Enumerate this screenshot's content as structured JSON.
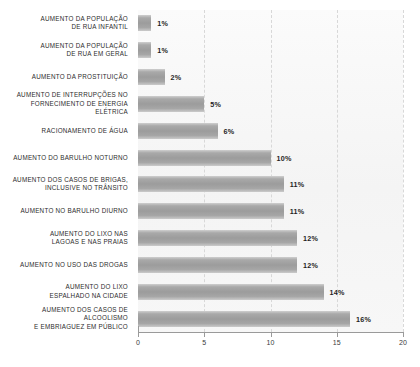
{
  "chart_data": {
    "type": "bar",
    "orientation": "horizontal",
    "title": "",
    "subtitle": "",
    "xlabel": "",
    "ylabel": "",
    "xlim": [
      0,
      20
    ],
    "xticks": [
      0,
      5,
      10,
      15,
      20
    ],
    "xtick_labels": [
      "0",
      "5",
      "10",
      "15",
      "20"
    ],
    "grid": true,
    "grid_axis": "x",
    "grid_style": "dashed",
    "legend": false,
    "value_suffix": "%",
    "bar_color": "#a3a3a3",
    "plot_background": "#f7f7f7",
    "categories": [
      "AUMENTO DA POPULAÇÃO\nDE RUA INFANTIL",
      "AUMENTO DA POPULAÇÃO\nDE RUA EM GERAL",
      "AUMENTO DA PROSTITUIÇÃO",
      "AUMENTO DE INTERRUPÇÕES NO\nFORNECIMENTO DE ENERGIA ELÉTRICA",
      "RACIONAMENTO DE ÁGUA",
      "AUMENTO DO BARULHO NOTURNO",
      "AUMENTO DOS CASOS DE BRIGAS,\nINCLUSIVE NO TRÂNSITO",
      "AUMENTO NO BARULHO DIURNO",
      "AUMENTO DO LIXO NAS\nLAGOAS E NAS PRAIAS",
      "AUMENTO NO USO DAS DROGAS",
      "AUMENTO DO LIXO\nESPALHADO NA CIDADE",
      "AUMENTO DOS CASOS DE ALCOOLISMO\nE EMBRIAGUEZ EM PÚBLICO"
    ],
    "values": [
      1,
      1,
      2,
      5,
      6,
      10,
      11,
      11,
      12,
      12,
      14,
      16
    ],
    "value_labels": [
      "1%",
      "1%",
      "2%",
      "5%",
      "6%",
      "10%",
      "11%",
      "11%",
      "12%",
      "12%",
      "14%",
      "16%"
    ]
  }
}
